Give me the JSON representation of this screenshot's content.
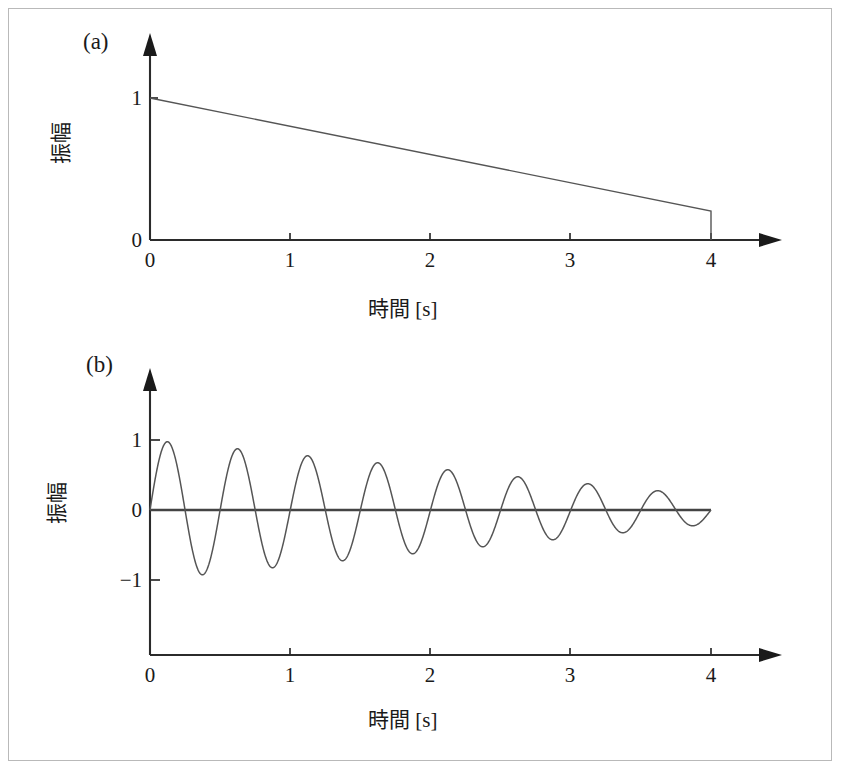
{
  "figure": {
    "panels": [
      {
        "tag": "(a)",
        "ylabel": "振幅",
        "xlabel": "時間 [s]",
        "xticks": [
          "0",
          "1",
          "2",
          "3",
          "4"
        ],
        "yticks": [
          "0",
          "1"
        ]
      },
      {
        "tag": "(b)",
        "ylabel": "振幅",
        "xlabel": "時間 [s]",
        "xticks": [
          "0",
          "1",
          "2",
          "3",
          "4"
        ],
        "yticks": [
          "1",
          "0",
          "−1"
        ]
      }
    ]
  },
  "chart_data": [
    {
      "type": "line",
      "title": "(a)",
      "xlabel": "時間 [s]",
      "ylabel": "振幅",
      "xlim": [
        0,
        4
      ],
      "ylim": [
        0,
        1
      ],
      "xticks": [
        0,
        1,
        2,
        3,
        4
      ],
      "yticks": [
        0,
        1
      ],
      "grid": false,
      "legend": "none",
      "series": [
        {
          "name": "amplitude envelope",
          "x": [
            0,
            0.5,
            1,
            1.5,
            2,
            2.5,
            3,
            3.5,
            4,
            4
          ],
          "values": [
            1.0,
            0.9,
            0.8,
            0.7,
            0.6,
            0.5,
            0.4,
            0.3,
            0.2,
            0.0
          ]
        }
      ],
      "annotations": "Envelope decays linearly from 1.0 at t=0 to 0.2 at t=4, then drops vertically to 0."
    },
    {
      "type": "line",
      "title": "(b)",
      "xlabel": "時間 [s]",
      "ylabel": "振幅",
      "xlim": [
        0,
        4
      ],
      "ylim": [
        -1,
        1
      ],
      "xticks": [
        0,
        1,
        2,
        3,
        4
      ],
      "yticks": [
        -1,
        0,
        1
      ],
      "grid": false,
      "legend": "none",
      "series": [
        {
          "name": "damped oscillation",
          "frequency_hz": 2,
          "envelope": {
            "start": 1.0,
            "end": 0.2,
            "shape": "linear"
          },
          "peaks_positive": [
            0.98,
            0.88,
            0.78,
            0.68,
            0.58,
            0.48,
            0.38,
            0.28
          ],
          "peaks_negative": [
            -0.93,
            -0.83,
            -0.73,
            -0.63,
            -0.53,
            -0.43,
            -0.33,
            -0.23
          ]
        }
      ],
      "annotations": "A(t)·sin(2π·2·t) with A(t) decreasing linearly from 1.0 to 0.2 over 0 ≤ t ≤ 4."
    }
  ]
}
